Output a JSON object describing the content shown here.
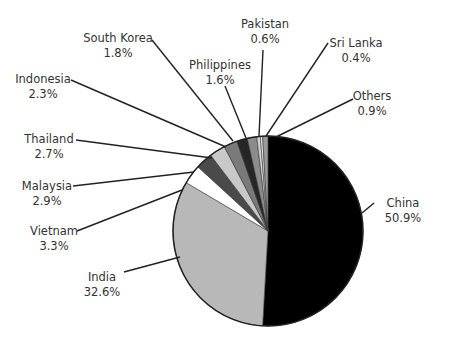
{
  "chart_data": {
    "type": "pie",
    "title": "",
    "start_angle_deg": 0,
    "direction": "clockwise",
    "categories": [
      "China",
      "India",
      "Vietnam",
      "Malaysia",
      "Thailand",
      "Indonesia",
      "South Korea",
      "Philippines",
      "Pakistan",
      "Sri Lanka",
      "Others"
    ],
    "values": [
      50.9,
      32.6,
      3.3,
      2.9,
      2.7,
      2.3,
      1.8,
      1.6,
      0.6,
      0.4,
      0.9
    ],
    "unit": "%",
    "colors": [
      "#000000",
      "#b8b8b8",
      "#ffffff",
      "#4a4a4a",
      "#c8c8c8",
      "#7a7a7a",
      "#262626",
      "#8c8c8c",
      "#d4d4d4",
      "#efefef",
      "#9a9a9a"
    ],
    "labels": [
      {
        "name": "China",
        "value_text": "50.9%"
      },
      {
        "name": "India",
        "value_text": "32.6%"
      },
      {
        "name": "Vietnam",
        "value_text": "3.3%"
      },
      {
        "name": "Malaysia",
        "value_text": "2.9%"
      },
      {
        "name": "Thailand",
        "value_text": "2.7%"
      },
      {
        "name": "Indonesia",
        "value_text": "2.3%"
      },
      {
        "name": "South Korea",
        "value_text": "1.8%"
      },
      {
        "name": "Philippines",
        "value_text": "1.6%"
      },
      {
        "name": "Pakistan",
        "value_text": "0.6%"
      },
      {
        "name": "Sri Lanka",
        "value_text": "0.4%"
      },
      {
        "name": "Others",
        "value_text": "0.9%"
      }
    ],
    "legend": "none",
    "data_labels": "outside with leader lines"
  }
}
